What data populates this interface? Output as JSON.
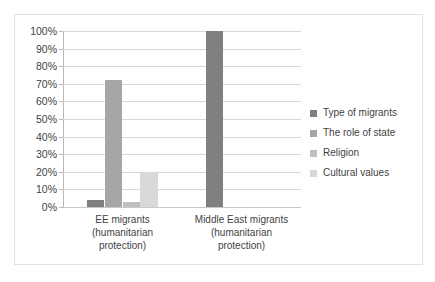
{
  "chart_data": {
    "type": "bar",
    "title": "",
    "subtitle": "",
    "xlabel": "",
    "ylabel": "",
    "ylim": [
      0,
      100
    ],
    "grid": true,
    "legend_position": "right",
    "categories": [
      "EE migrants (humanitarian protection)",
      "Middle East migrants (humanitarian protection)"
    ],
    "category_lines": [
      [
        "EE migrants",
        "(humanitarian",
        "protection)"
      ],
      [
        "Middle East migrants",
        "(humanitarian",
        "protection)"
      ]
    ],
    "ytick_labels": [
      "100%",
      "90%",
      "80%",
      "70%",
      "60%",
      "50%",
      "40%",
      "30%",
      "20%",
      "10%",
      "0%"
    ],
    "ytick_values": [
      100,
      90,
      80,
      70,
      60,
      50,
      40,
      30,
      20,
      10,
      0
    ],
    "series": [
      {
        "name": "Type of migrants",
        "color": "#808080",
        "values": [
          4,
          100
        ]
      },
      {
        "name": "The role of state",
        "color": "#a6a6a6",
        "values": [
          72,
          0
        ]
      },
      {
        "name": "Religion",
        "color": "#bfbfbf",
        "values": [
          3,
          0
        ]
      },
      {
        "name": "Cultural values",
        "color": "#d9d9d9",
        "values": [
          20,
          0
        ]
      }
    ]
  },
  "legend": {
    "entries": [
      {
        "label": "Type of migrants",
        "color": "#808080"
      },
      {
        "label": "The role of state",
        "color": "#a6a6a6"
      },
      {
        "label": "Religion",
        "color": "#bfbfbf"
      },
      {
        "label": "Cultural values",
        "color": "#d9d9d9"
      }
    ]
  },
  "colors": {
    "panel_border": "#e2e2e2",
    "gridline": "#d8d8d8",
    "axis": "#b7b7b7",
    "text": "#3f3f3f",
    "background": "#ffffff"
  }
}
